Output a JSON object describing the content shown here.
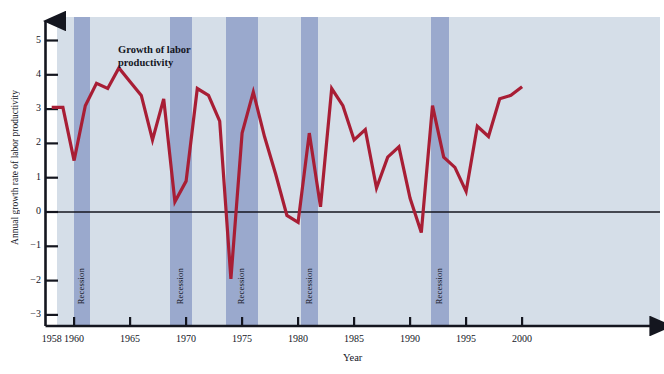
{
  "chart_data": {
    "type": "line",
    "title": "",
    "xlabel": "Year",
    "ylabel": "Annual growth rate of labor productivity",
    "xlim": [
      1958,
      2001
    ],
    "ylim": [
      -3.4,
      5.6
    ],
    "xticks": [
      1958,
      1960,
      1965,
      1970,
      1975,
      1980,
      1985,
      1990,
      1995,
      2000
    ],
    "xtick_labels": [
      "1958",
      "1960",
      "1965",
      "1970",
      "1975",
      "1980",
      "1985",
      "1990",
      "1995",
      "2000"
    ],
    "yticks": [
      -3,
      -2,
      -1,
      0,
      1,
      2,
      3,
      4,
      5
    ],
    "ytick_labels": [
      "−3",
      "−2",
      "−1",
      "0",
      "1",
      "2",
      "3",
      "4",
      "5"
    ],
    "grid": false,
    "legend": "none",
    "zero_line": true,
    "series": [
      {
        "name": "Growth of labor productivity",
        "color": "#a81e35",
        "x": [
          1958,
          1959,
          1960,
          1961,
          1962,
          1963,
          1964,
          1965,
          1966,
          1967,
          1968,
          1969,
          1970,
          1971,
          1972,
          1973,
          1974,
          1975,
          1976,
          1977,
          1978,
          1979,
          1980,
          1981,
          1982,
          1983,
          1984,
          1985,
          1986,
          1987,
          1988,
          1989,
          1990,
          1991,
          1992,
          1993,
          1994,
          1995,
          1996,
          1997,
          1998,
          1999,
          2000
        ],
        "y": [
          3.05,
          3.05,
          1.5,
          3.1,
          3.75,
          3.6,
          4.2,
          3.8,
          3.4,
          2.1,
          3.3,
          0.3,
          0.9,
          3.6,
          3.4,
          2.65,
          -1.95,
          2.3,
          3.5,
          2.2,
          1.1,
          -0.1,
          -0.3,
          2.3,
          0.15,
          3.6,
          3.1,
          2.1,
          2.4,
          0.7,
          1.6,
          1.9,
          0.4,
          -0.6,
          3.1,
          1.6,
          1.3,
          0.6,
          2.5,
          2.2,
          3.3,
          3.4,
          3.65
        ]
      }
    ],
    "recessions": [
      {
        "label": "Recession",
        "start": 1960.0,
        "end": 1961.4
      },
      {
        "label": "Recession",
        "start": 1968.6,
        "end": 1970.5
      },
      {
        "label": "Recession",
        "start": 1973.6,
        "end": 1976.4
      },
      {
        "label": "Recession",
        "start": 1980.3,
        "end": 1981.8
      },
      {
        "label": "Recession",
        "start": 1991.9,
        "end": 1993.5
      }
    ],
    "annotations": [
      {
        "text_line1": "Growth of labor",
        "text_line2": "productivity",
        "x": 118,
        "y": 48
      }
    ]
  },
  "colors": {
    "plot_background": "#d5dee8",
    "recession_band": "#9aa9cd",
    "series_line": "#a81e35",
    "axis": "#14161f",
    "page_background": "#ffffff"
  }
}
